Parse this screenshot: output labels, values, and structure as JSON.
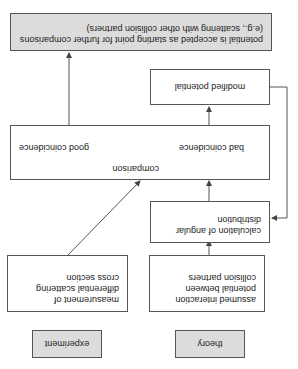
{
  "diagram": {
    "theory_label": "theory",
    "experiment_label": "experiment",
    "assumed_potential": "assumed interaction potential between collision partners",
    "measurement": "measurement of differential scattering cross section",
    "calculation": "calculation of angular distribution",
    "comparison": {
      "title": "comparison",
      "bad": "bad coincidence",
      "good": "good coincidence"
    },
    "modified_potential": "modified potential",
    "accepted": "potential is accepted as starting point for further comparisons (e.g., scattering with other collision partners)",
    "orientation": "rotated 180°"
  }
}
